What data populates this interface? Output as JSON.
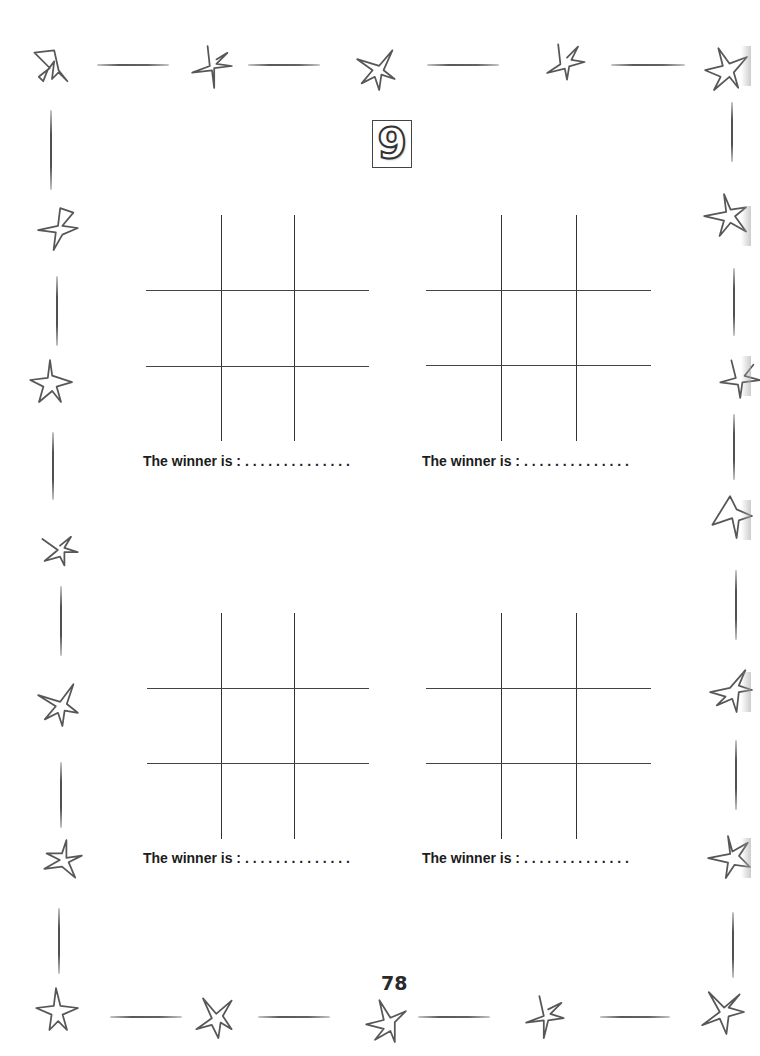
{
  "page": {
    "activity_number": "9",
    "page_number": "78"
  },
  "boards": [
    {
      "winner_label": "The winner is :",
      "winner_blank": ". . . . . . . . . . . . . ."
    },
    {
      "winner_label": "The winner is :",
      "winner_blank": ". . . . . . . . . . . . . ."
    },
    {
      "winner_label": "The winner is :",
      "winner_blank": ". . . . . . . . . . . . . ."
    },
    {
      "winner_label": "The winner is :",
      "winner_blank": ". . . . . . . . . . . . . ."
    }
  ],
  "border": {
    "decoration": "hand-drawn stars and dashes",
    "stroke_color": "#3a3a3a"
  }
}
